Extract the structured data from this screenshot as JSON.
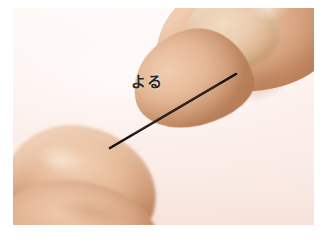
{
  "page": {
    "background_color": "#ffffff",
    "width": 330,
    "height": 239
  },
  "photo": {
    "name": "hands-holding-needle-photo",
    "alt_description": "Close-up photograph of two hands, fingertips pinching a thin dark needle held diagonally against a pale pink background",
    "frame": {
      "left": 13,
      "top": 8,
      "width": 301,
      "height": 217
    },
    "backdrop_color": "#fdf2ee",
    "skin_color_right_hand": "#e3b391",
    "skin_color_left_hand": "#e0b291",
    "focus_note": "right hand sharp, left hand softly out of focus"
  },
  "caption": {
    "text": "よる",
    "romaji_reading": "yoru",
    "color": "#2b2724",
    "position": {
      "left": 131,
      "top": 75
    }
  },
  "needle": {
    "color": "#15110f",
    "start_point": {
      "x": 110,
      "y": 148
    },
    "end_point": {
      "x": 236,
      "y": 74
    },
    "thickness_px": 2.6
  }
}
